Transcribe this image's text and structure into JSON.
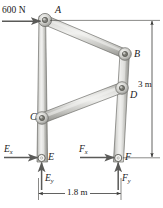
{
  "figure": {
    "colors": {
      "member_light": "#e6e6e4",
      "member_mid": "#b9b9b5",
      "member_dark": "#8e8e8a",
      "outline": "#6d6d69",
      "arrow": "#5a5a58",
      "dimension": "#3a3a38",
      "text": "#1a1a1a"
    },
    "joints": [
      {
        "id": "A",
        "label": "A",
        "x": 45,
        "y": 20
      },
      {
        "id": "B",
        "label": "B",
        "x": 125,
        "y": 54
      },
      {
        "id": "C",
        "label": "C",
        "x": 42,
        "y": 118
      },
      {
        "id": "D",
        "label": "D",
        "x": 122,
        "y": 88
      },
      {
        "id": "E",
        "label": "E",
        "x": 41,
        "y": 158
      },
      {
        "id": "F",
        "label": "F",
        "x": 118,
        "y": 158
      }
    ],
    "members": [
      {
        "id": "AB",
        "from": "A",
        "to": "B"
      },
      {
        "id": "CD",
        "from": "C",
        "to": "D"
      },
      {
        "id": "AE",
        "from": "A",
        "to": "E"
      },
      {
        "id": "BF",
        "from": "B",
        "to": "F"
      }
    ],
    "loads": [
      {
        "id": "applied-load",
        "label": "600 N",
        "at": "A",
        "direction": "right"
      },
      {
        "id": "reaction-ex",
        "label": "E",
        "sub": "x",
        "at": "E",
        "direction": "right"
      },
      {
        "id": "reaction-ey",
        "label": "E",
        "sub": "y",
        "at": "E",
        "direction": "up"
      },
      {
        "id": "reaction-fx",
        "label": "F",
        "sub": "x",
        "at": "F",
        "direction": "right"
      },
      {
        "id": "reaction-fy",
        "label": "F",
        "sub": "y",
        "at": "F",
        "direction": "up"
      }
    ],
    "dimensions": [
      {
        "id": "height",
        "label": "3 m",
        "orientation": "vertical",
        "from": "A",
        "to": "F"
      },
      {
        "id": "width",
        "label": "1.8 m",
        "orientation": "horizontal",
        "from": "E",
        "to": "F"
      }
    ]
  },
  "labels": {
    "load_600n": "600 N",
    "point_a": "A",
    "point_b": "B",
    "point_c": "C",
    "point_d": "D",
    "point_e": "E",
    "point_f": "F",
    "ex_main": "E",
    "ex_sub": "x",
    "ey_main": "E",
    "ey_sub": "y",
    "fx_main": "F",
    "fx_sub": "x",
    "fy_main": "F",
    "fy_sub": "y",
    "dim_height": "3 m",
    "dim_width": "1.8 m"
  }
}
